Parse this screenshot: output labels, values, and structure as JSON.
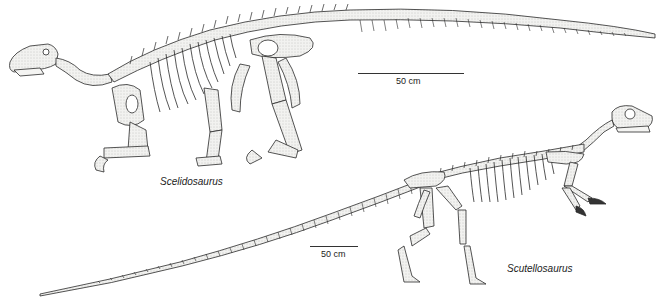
{
  "figure": {
    "specimens": [
      {
        "name": "Scelidosaurus",
        "scale_bar": {
          "label": "50 cm"
        }
      },
      {
        "name": "Scutellosaurus",
        "scale_bar": {
          "label": "50 cm"
        }
      }
    ],
    "colors": {
      "bone_fill": "#f4f4f2",
      "bone_stroke": "#2a2a2a",
      "shade": "#b8b8b8",
      "background": "#ffffff"
    }
  }
}
